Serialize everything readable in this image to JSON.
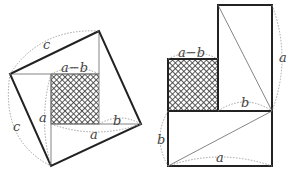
{
  "figure": {
    "colors": {
      "stroke": "#222222",
      "thin_stroke": "#666666",
      "dotted": "#999999",
      "hatch": "#333333"
    },
    "left_figure": {
      "labels": {
        "c_top": "c",
        "c_left": "c",
        "a_minus_b": "a−b",
        "a_vertical": "a",
        "a_horizontal": "a",
        "b": "b"
      }
    },
    "right_figure": {
      "labels": {
        "a_minus_b": "a−b",
        "a_right": "a",
        "b_middle": "b",
        "b_left": "b",
        "a_bottom": "a"
      }
    }
  }
}
